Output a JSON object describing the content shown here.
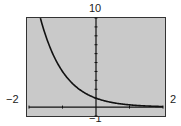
{
  "window": {
    "xmin_label": "−2",
    "xmax_label": "2",
    "ymin_label": "−1",
    "ymax_label": "10"
  },
  "colors": {
    "screen": "#c9c9c9",
    "curve": "#111111",
    "axis": "#111111"
  },
  "chart_data": {
    "type": "line",
    "title": "",
    "xlabel": "",
    "ylabel": "",
    "xlim": [
      -2,
      2
    ],
    "ylim": [
      -1,
      10
    ],
    "grid": false,
    "xscl": 1,
    "yscl": 1,
    "function": "y = 4^(-x)",
    "series": [
      {
        "name": "y = 4^(-x)",
        "x": [
          -1.66,
          -1.5,
          -1.25,
          -1.0,
          -0.75,
          -0.5,
          -0.25,
          0,
          0.25,
          0.5,
          0.75,
          1.0,
          1.25,
          1.5,
          1.75,
          2.0
        ],
        "y": [
          10.0,
          8.0,
          5.66,
          4.0,
          2.83,
          2.0,
          1.41,
          1.0,
          0.71,
          0.5,
          0.35,
          0.25,
          0.18,
          0.13,
          0.09,
          0.06
        ]
      }
    ]
  }
}
